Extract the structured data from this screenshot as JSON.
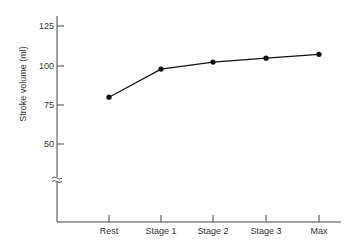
{
  "chart_data": {
    "type": "line",
    "title": "",
    "xlabel": "",
    "ylabel": "Stroke volume (ml)",
    "categories": [
      "Rest",
      "Stage 1",
      "Stage 2",
      "Stage 3",
      "Max"
    ],
    "series": [
      {
        "name": "Stroke volume",
        "values": [
          80,
          98,
          102.5,
          105,
          107.5
        ]
      }
    ],
    "yticks": [
      50,
      75,
      100,
      125
    ],
    "ytick_labels": [
      "50",
      "75",
      "100",
      "125"
    ],
    "axis_break": true,
    "grid": false,
    "legend": "none"
  },
  "colors": {
    "line": "#111111",
    "axis": "#444444",
    "text": "#333333"
  }
}
